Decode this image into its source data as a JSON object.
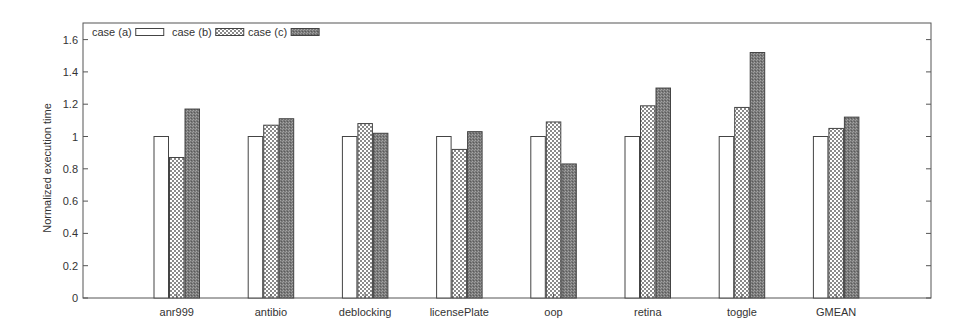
{
  "chart_data": {
    "type": "bar",
    "title": "",
    "xlabel": "",
    "ylabel": "Normalized execution time",
    "ylim": [
      0,
      1.7
    ],
    "yticks": [
      0,
      0.2,
      0.4,
      0.6,
      0.8,
      1,
      1.2,
      1.4,
      1.6
    ],
    "ytick_labels": [
      "0",
      "0.2",
      "0.4",
      "0.6",
      "0.8",
      "1",
      "1.2",
      "1.4",
      "1.6"
    ],
    "grid": false,
    "legend_position": "top-left, inside, horizontal",
    "categories": [
      "anr999",
      "antibio",
      "deblocking",
      "licensePlate",
      "oop",
      "retina",
      "toggle",
      "GMEAN"
    ],
    "series": [
      {
        "name": "case (a)",
        "pattern": "white",
        "values": [
          1.0,
          1.0,
          1.0,
          1.0,
          1.0,
          1.0,
          1.0,
          1.0
        ]
      },
      {
        "name": "case (b)",
        "pattern": "checkerboard",
        "values": [
          0.87,
          1.07,
          1.08,
          0.92,
          1.09,
          1.19,
          1.18,
          1.05
        ]
      },
      {
        "name": "case (c)",
        "pattern": "dark-dotted",
        "values": [
          1.17,
          1.11,
          1.02,
          1.03,
          0.83,
          1.3,
          1.52,
          1.12
        ]
      }
    ]
  }
}
